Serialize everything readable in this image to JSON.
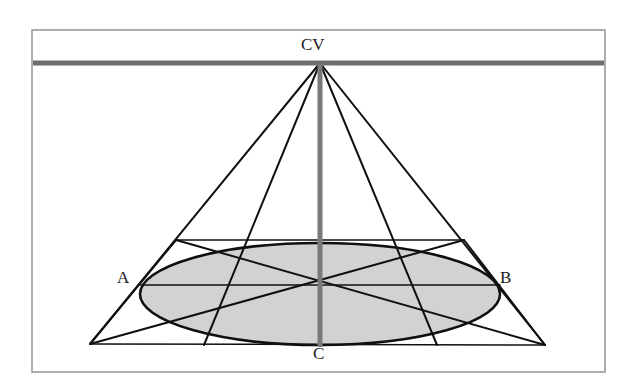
{
  "figure": {
    "type": "perspective-geometry-diagram",
    "background_color": "#ffffff"
  },
  "frame": {
    "name": "outer-border",
    "x": 32,
    "y": 30,
    "width": 573,
    "height": 342,
    "stroke_color": "#9a9a9a",
    "stroke_width": 1.6
  },
  "horizon": {
    "label": "horizon-line",
    "y": 63,
    "x_start": 33,
    "x_end": 604,
    "color": "#6e6e6e",
    "stroke_width": 5
  },
  "axis": {
    "label": "central-vertical-axis",
    "x": 320,
    "y_top": 63,
    "y_bottom": 347,
    "color": "#7a7a7a",
    "stroke_width": 5
  },
  "points": {
    "cv": {
      "label": "CV",
      "x": 320,
      "y": 63,
      "description": "central vanishing point at apex on horizon"
    },
    "a": {
      "label": "A",
      "x": 140,
      "y": 285,
      "description": "left extreme of ellipse"
    },
    "b": {
      "label": "B",
      "x": 500,
      "y": 285,
      "description": "right extreme of ellipse"
    },
    "c": {
      "label": "C",
      "x": 320,
      "y": 345,
      "description": "near point of ellipse on vertical axis"
    },
    "base_left": {
      "label": "base-left-vertex",
      "x": 90,
      "y": 344
    },
    "base_right": {
      "label": "base-right-vertex",
      "x": 545,
      "y": 345
    },
    "far_left": {
      "label": "far-left-corner",
      "x": 176,
      "y": 240
    },
    "far_right": {
      "label": "far-right-corner",
      "x": 464,
      "y": 240
    },
    "tangent_left": {
      "label": "left-front-tangent",
      "x": 204,
      "y": 345
    },
    "tangent_right": {
      "label": "right-front-tangent",
      "x": 437,
      "y": 345
    },
    "center": {
      "label": "ellipse-center",
      "x": 320,
      "y": 285
    }
  },
  "ellipse": {
    "label": "inscribed-ellipse",
    "cx": 320,
    "cy": 294,
    "rx": 180,
    "ry": 51,
    "fill_color": "#d2d2d2",
    "stroke_color": "#101010",
    "stroke_width": 2.6
  },
  "lines": {
    "stroke_color": "#101010",
    "stroke_width": 2.0,
    "thin_stroke_width": 1.5,
    "items": [
      {
        "name": "cone-side-left",
        "x1": 320,
        "y1": 63,
        "x2": 90,
        "y2": 344
      },
      {
        "name": "cone-side-right",
        "x1": 320,
        "y1": 63,
        "x2": 545,
        "y2": 345
      },
      {
        "name": "vanish-ray-left",
        "x1": 320,
        "y1": 63,
        "x2": 204,
        "y2": 345
      },
      {
        "name": "vanish-ray-right",
        "x1": 320,
        "y1": 63,
        "x2": 437,
        "y2": 345
      },
      {
        "name": "base-line-bottom",
        "x1": 90,
        "y1": 344,
        "x2": 545,
        "y2": 345
      },
      {
        "name": "far-edge-horizontal",
        "x1": 176,
        "y1": 240,
        "x2": 464,
        "y2": 240
      },
      {
        "name": "square-edge-left",
        "x1": 176,
        "y1": 240,
        "x2": 90,
        "y2": 344
      },
      {
        "name": "square-edge-right",
        "x1": 464,
        "y1": 240,
        "x2": 545,
        "y2": 345
      },
      {
        "name": "diagonal-a-to-right",
        "x1": 176,
        "y1": 240,
        "x2": 545,
        "y2": 345
      },
      {
        "name": "diagonal-b-to-left",
        "x1": 464,
        "y1": 240,
        "x2": 90,
        "y2": 344
      },
      {
        "name": "midline-ab",
        "x1": 140,
        "y1": 285,
        "x2": 500,
        "y2": 285
      }
    ]
  },
  "labels": {
    "cv": "CV",
    "a": "A",
    "b": "B",
    "c": "C"
  }
}
